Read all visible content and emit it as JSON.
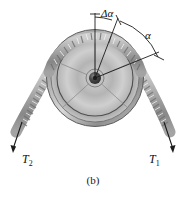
{
  "figure": {
    "caption": "(b)",
    "labels": {
      "delta_alpha": "Δα",
      "alpha": "α",
      "tension_left": "T",
      "tension_left_sub": "2",
      "tension_right": "T",
      "tension_right_sub": "1"
    },
    "colors": {
      "background": "#ffffff",
      "rim_dark": "#6f6f6f",
      "rim_light": "#e8e8e8",
      "disc_mid": "#b9b9b9",
      "hub_dark": "#3a3a3a",
      "rope_dark": "#8d8d8d",
      "rope_light": "#e3e3e3",
      "line": "#1c1c1c"
    },
    "geometry": {
      "wheel_center_x": 95,
      "wheel_center_y": 78,
      "wheel_radius": 48,
      "inner_ring_radius": 38,
      "hub_radius": 8,
      "spoke_count": 5
    }
  }
}
